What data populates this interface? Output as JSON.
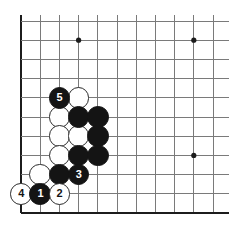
{
  "diagram": {
    "board": {
      "cols": 11,
      "rows": 11,
      "origin_x": 21,
      "origin_y": 21,
      "spacing": 19.2,
      "line_color": "#7a7a7a",
      "edge_color": "#1c1c1c",
      "background": "#ffffff",
      "star_points": [
        {
          "name": "star-point-upper-left",
          "col": 4,
          "row": 2
        },
        {
          "name": "star-point-upper-right",
          "col": 10,
          "row": 2
        },
        {
          "name": "star-point-lower-right",
          "col": 10,
          "row": 8
        }
      ],
      "edges": {
        "left": true,
        "bottom": true,
        "top": false,
        "right": false
      }
    },
    "colors": {
      "black_stone": "#141414",
      "white_stone": "#ffffff",
      "stone_outline": "#2a2a2a",
      "number_on_black": "#ffffff",
      "number_on_white": "#141414"
    },
    "stones": [
      {
        "id": "stone-w-c4r5",
        "color": "white",
        "col": 4,
        "row": 5,
        "label": ""
      },
      {
        "id": "stone-b-c3r5",
        "color": "black",
        "col": 3,
        "row": 5,
        "label": "5"
      },
      {
        "id": "stone-w-c3r6",
        "color": "white",
        "col": 3,
        "row": 6,
        "label": ""
      },
      {
        "id": "stone-b-c4r6",
        "color": "black",
        "col": 4,
        "row": 6,
        "label": ""
      },
      {
        "id": "stone-b-c5r6",
        "color": "black",
        "col": 5,
        "row": 6,
        "label": ""
      },
      {
        "id": "stone-w-c3r7",
        "color": "white",
        "col": 3,
        "row": 7,
        "label": ""
      },
      {
        "id": "stone-w-c4r7",
        "color": "white",
        "col": 4,
        "row": 7,
        "label": ""
      },
      {
        "id": "stone-b-c5r7",
        "color": "black",
        "col": 5,
        "row": 7,
        "label": ""
      },
      {
        "id": "stone-w-c3r8",
        "color": "white",
        "col": 3,
        "row": 8,
        "label": ""
      },
      {
        "id": "stone-b-c4r8",
        "color": "black",
        "col": 4,
        "row": 8,
        "label": ""
      },
      {
        "id": "stone-b-c5r8",
        "color": "black",
        "col": 5,
        "row": 8,
        "label": ""
      },
      {
        "id": "stone-w-c2r9",
        "color": "white",
        "col": 2,
        "row": 9,
        "label": ""
      },
      {
        "id": "stone-b-c3r9",
        "color": "black",
        "col": 3,
        "row": 9,
        "label": ""
      },
      {
        "id": "stone-b-c4r9",
        "color": "black",
        "col": 4,
        "row": 9,
        "label": "3"
      },
      {
        "id": "stone-w-c1r10",
        "color": "white",
        "col": 1,
        "row": 10,
        "label": "4"
      },
      {
        "id": "stone-b-c2r10",
        "color": "black",
        "col": 2,
        "row": 10,
        "label": "1"
      },
      {
        "id": "stone-w-c3r10",
        "color": "white",
        "col": 3,
        "row": 10,
        "label": "2"
      }
    ],
    "move_sequence": [
      {
        "number": "1",
        "color": "black"
      },
      {
        "number": "2",
        "color": "white"
      },
      {
        "number": "3",
        "color": "black"
      },
      {
        "number": "4",
        "color": "white"
      },
      {
        "number": "5",
        "color": "black"
      }
    ]
  }
}
